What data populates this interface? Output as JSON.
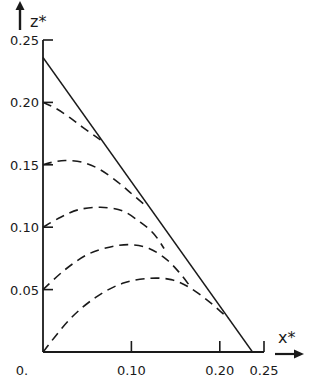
{
  "chart_data": {
    "type": "line",
    "title": "",
    "xlabel": "x*",
    "ylabel": "z*",
    "xlim": [
      0,
      0.25
    ],
    "ylim": [
      0,
      0.25
    ],
    "grid": false,
    "legend": null,
    "x_ticks": [
      {
        "value": 0.1,
        "label": "0.10"
      },
      {
        "value": 0.2,
        "label": "0.20"
      },
      {
        "value": 0.25,
        "label": "0.25"
      }
    ],
    "y_ticks": [
      {
        "value": 0.05,
        "label": "0.05"
      },
      {
        "value": 0.1,
        "label": "0.10"
      },
      {
        "value": 0.15,
        "label": "0.15"
      },
      {
        "value": 0.2,
        "label": "0.20"
      },
      {
        "value": 0.25,
        "label": "0.25"
      }
    ],
    "origin_label": "0.",
    "series": [
      {
        "name": "boundary",
        "style": "solid",
        "x": [
          0,
          0.237
        ],
        "y": [
          0.236,
          0
        ]
      },
      {
        "name": "curve z0=0.20",
        "style": "dashed",
        "x": [
          0,
          0.015,
          0.03,
          0.045,
          0.065
        ],
        "y": [
          0.2,
          0.195,
          0.188,
          0.18,
          0.17
        ]
      },
      {
        "name": "curve z0=0.15",
        "style": "dashed",
        "x": [
          0,
          0.01,
          0.025,
          0.045,
          0.065,
          0.085,
          0.1,
          0.115
        ],
        "y": [
          0.15,
          0.152,
          0.1535,
          0.152,
          0.146,
          0.136,
          0.127,
          0.118
        ]
      },
      {
        "name": "curve z0=0.10",
        "style": "dashed",
        "x": [
          0,
          0.02,
          0.04,
          0.065,
          0.09,
          0.11,
          0.125,
          0.137
        ],
        "y": [
          0.1,
          0.108,
          0.114,
          0.116,
          0.113,
          0.104,
          0.095,
          0.083
        ]
      },
      {
        "name": "curve z0=0.05",
        "style": "dashed",
        "x": [
          0,
          0.025,
          0.05,
          0.075,
          0.098,
          0.12,
          0.14,
          0.155,
          0.167
        ],
        "y": [
          0.05,
          0.066,
          0.078,
          0.084,
          0.086,
          0.083,
          0.074,
          0.063,
          0.052
        ]
      },
      {
        "name": "curve z0=0",
        "style": "dashed",
        "x": [
          0,
          0.03,
          0.06,
          0.09,
          0.12,
          0.145,
          0.165,
          0.185,
          0.2,
          0.21
        ],
        "y": [
          0,
          0.026,
          0.044,
          0.055,
          0.059,
          0.058,
          0.052,
          0.042,
          0.033,
          0.027
        ]
      }
    ]
  }
}
